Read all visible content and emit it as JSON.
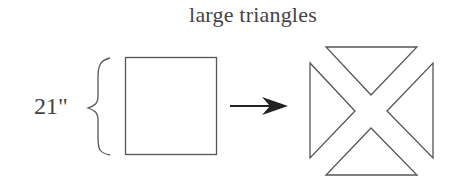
{
  "title": "large triangles",
  "dimension_label": "21\"",
  "colors": {
    "stroke": "#555555",
    "arrow": "#222222",
    "text": "#444444",
    "background": "#ffffff"
  },
  "shapes": {
    "source": "square",
    "transform": "arrow-right",
    "result": "four large triangles (square cut on both diagonals)",
    "triangle_count": 4
  }
}
